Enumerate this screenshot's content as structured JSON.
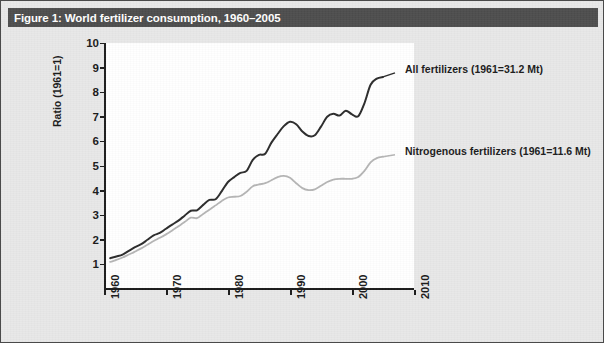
{
  "figure": {
    "title": "Figure 1: World fertilizer consumption, 1960–2005",
    "title_bar_color": "#4d4d4d",
    "page_background": "#e8e8e8",
    "plot_background": "#ffffff"
  },
  "chart_data": {
    "type": "line",
    "title": "Figure 1: World fertilizer consumption, 1960–2005",
    "xlabel": "",
    "ylabel": "Ratio (1961=1)",
    "xlim": [
      1960,
      2010
    ],
    "ylim": [
      0,
      10
    ],
    "grid": false,
    "legend_position": "inline-annotation",
    "xticks": [
      "1960",
      "1970",
      "1980",
      "1990",
      "2000",
      "2010"
    ],
    "xtick_values": [
      1960,
      1970,
      1980,
      1990,
      2000,
      2010
    ],
    "yticks": [
      "1",
      "2",
      "3",
      "4",
      "5",
      "6",
      "7",
      "8",
      "9",
      "10"
    ],
    "ytick_values": [
      1,
      2,
      3,
      4,
      5,
      6,
      7,
      8,
      9,
      10
    ],
    "x": [
      1961,
      1962,
      1963,
      1964,
      1965,
      1966,
      1967,
      1968,
      1969,
      1970,
      1971,
      1972,
      1973,
      1974,
      1975,
      1976,
      1977,
      1978,
      1979,
      1980,
      1981,
      1982,
      1983,
      1984,
      1985,
      1986,
      1987,
      1988,
      1989,
      1990,
      1991,
      1992,
      1993,
      1994,
      1995,
      1996,
      1997,
      1998,
      1999,
      2000,
      2001,
      2002,
      2003,
      2004,
      2005
    ],
    "series": [
      {
        "name": "All fertilizers (1961=31.2 Mt)",
        "color": "#2b2b2b",
        "base_1961_Mt": 31.2,
        "values": [
          1.25,
          1.32,
          1.4,
          1.55,
          1.7,
          1.82,
          2.0,
          2.18,
          2.28,
          2.45,
          2.62,
          2.78,
          2.98,
          3.18,
          3.2,
          3.42,
          3.62,
          3.65,
          3.98,
          4.35,
          4.55,
          4.72,
          4.8,
          5.25,
          5.45,
          5.5,
          5.95,
          6.3,
          6.62,
          6.8,
          6.7,
          6.4,
          6.22,
          6.25,
          6.6,
          7.0,
          7.12,
          7.05,
          7.25,
          7.1,
          7.02,
          7.55,
          8.3,
          8.55,
          8.62
        ]
      },
      {
        "name": "Nitrogenous fertilizers (1961=11.6 Mt)",
        "color": "#b5b5b5",
        "base_1961_Mt": 11.6,
        "values": [
          1.1,
          1.18,
          1.28,
          1.4,
          1.52,
          1.65,
          1.8,
          1.95,
          2.08,
          2.22,
          2.38,
          2.55,
          2.72,
          2.9,
          2.88,
          3.05,
          3.22,
          3.4,
          3.58,
          3.72,
          3.75,
          3.78,
          3.95,
          4.18,
          4.25,
          4.3,
          4.42,
          4.55,
          4.6,
          4.52,
          4.3,
          4.1,
          4.02,
          4.05,
          4.2,
          4.35,
          4.45,
          4.48,
          4.48,
          4.48,
          4.55,
          4.8,
          5.15,
          5.32,
          5.38
        ]
      }
    ],
    "annotations": [
      {
        "text": "All fertilizers (1961=31.2 Mt)",
        "target_series": "All fertilizers (1961=31.2 Mt)"
      },
      {
        "text": "Nitrogenous fertilizers (1961=11.6 Mt)",
        "target_series": "Nitrogenous fertilizers (1961=11.6 Mt)"
      }
    ]
  }
}
